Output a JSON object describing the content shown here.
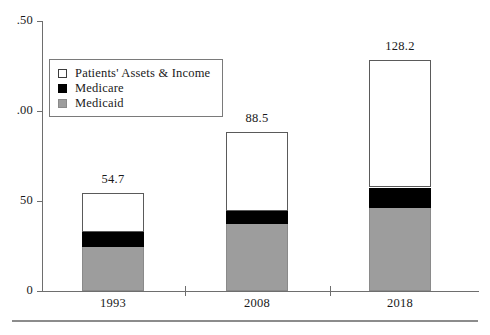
{
  "chart_data": {
    "type": "bar",
    "subtype": "stacked-vertical",
    "title": "",
    "xlabel": "",
    "ylabel": "",
    "categories": [
      "1993",
      "2008",
      "2018"
    ],
    "series": [
      {
        "name": "Medicaid",
        "color": "#9d9d9d",
        "values": [
          24.5,
          37.0,
          46.0
        ]
      },
      {
        "name": "Medicare",
        "color": "#000000",
        "values": [
          8.5,
          7.5,
          11.5
        ]
      },
      {
        "name": "Patients' Assets & Income",
        "color": "#ffffff",
        "values": [
          21.7,
          44.0,
          70.7
        ]
      }
    ],
    "totals": [
      54.7,
      88.5,
      128.2
    ],
    "total_labels": [
      "54.7",
      "88.5",
      "128.2"
    ],
    "ylim": [
      0,
      150
    ],
    "yticks": [
      0,
      50,
      100,
      150
    ],
    "ytick_labels": [
      "0",
      "50",
      ".00",
      ".50"
    ],
    "grid": false,
    "legend_position": "upper-left"
  },
  "legend": {
    "items": [
      {
        "label": "Patients' Assets & Income",
        "swatch": "white-square-swatch"
      },
      {
        "label": "Medicare",
        "swatch": "black-square-swatch"
      },
      {
        "label": "Medicaid",
        "swatch": "gray-square-swatch"
      }
    ]
  },
  "axes": {
    "y_tick_labels": [
      "0",
      "50",
      ".00",
      ".50"
    ],
    "x_tick_labels": [
      "1993",
      "2008",
      "2018"
    ]
  },
  "colors": {
    "medicaid": "#9d9d9d",
    "medicare": "#000000",
    "assets": "#ffffff",
    "axis": "#6e6e6e",
    "text": "#1a1a1a"
  }
}
